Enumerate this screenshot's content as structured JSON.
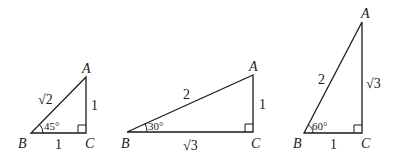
{
  "figure": {
    "triangles": [
      {
        "id": "45-45-90",
        "vertices": {
          "A": "A",
          "B": "B",
          "C": "C"
        },
        "sides": {
          "AB": "√2",
          "AC": "1",
          "BC": "1"
        },
        "angle_B": "45°",
        "right_angle_at": "C"
      },
      {
        "id": "30-60-90-flat",
        "vertices": {
          "A": "A",
          "B": "B",
          "C": "C"
        },
        "sides": {
          "AB": "2",
          "AC": "1",
          "BC": "√3"
        },
        "angle_B": "30°",
        "right_angle_at": "C"
      },
      {
        "id": "30-60-90-tall",
        "vertices": {
          "A": "A",
          "B": "B",
          "C": "C"
        },
        "sides": {
          "AB": "2",
          "AC": "√3",
          "BC": "1"
        },
        "angle_B": "60°",
        "right_angle_at": "C"
      }
    ]
  }
}
